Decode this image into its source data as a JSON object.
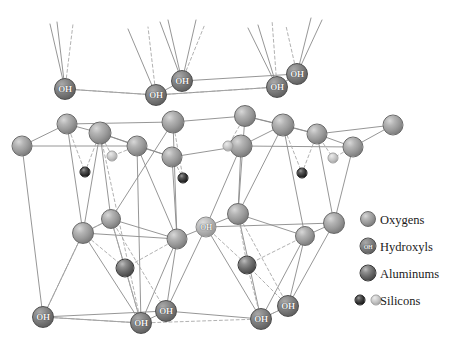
{
  "figure": {
    "background_color": "#ffffff",
    "width": 450,
    "height": 341
  },
  "legend": {
    "items": [
      {
        "label": "Oxygens",
        "species": "oxygen",
        "color": "#9a9a9a",
        "atom_label": ""
      },
      {
        "label": "Hydroxyls",
        "species": "hydroxyl",
        "color": "#757575",
        "atom_label": "OH"
      },
      {
        "label": "Aluminums",
        "species": "aluminum",
        "color": "#6b6b6b",
        "atom_label": ""
      },
      {
        "label": "Silicons",
        "species": "silicon",
        "color": "#333333",
        "atom_label": ""
      }
    ]
  },
  "atom_labels": {
    "hydroxyl": "OH"
  },
  "structure": {
    "atoms": [
      {
        "name": "hydroxyl-top-1",
        "species": "hydroxyl",
        "x": 65,
        "y": 89,
        "r": 11,
        "label": "OH"
      },
      {
        "name": "hydroxyl-top-2",
        "species": "hydroxyl",
        "x": 156,
        "y": 95,
        "r": 11,
        "label": "OH"
      },
      {
        "name": "hydroxyl-top-3",
        "species": "hydroxyl",
        "x": 182,
        "y": 81,
        "r": 11,
        "label": "OH"
      },
      {
        "name": "hydroxyl-top-4",
        "species": "hydroxyl",
        "x": 277,
        "y": 87,
        "r": 11,
        "label": "OH"
      },
      {
        "name": "hydroxyl-top-5",
        "species": "hydroxyl",
        "x": 297,
        "y": 74,
        "r": 11,
        "label": "OH"
      },
      {
        "name": "oxygen-u-1",
        "species": "oxygen",
        "x": 22,
        "y": 146,
        "r": 10.5,
        "label": ""
      },
      {
        "name": "oxygen-u-2",
        "species": "oxygen",
        "x": 67,
        "y": 124,
        "r": 10.5,
        "label": ""
      },
      {
        "name": "oxygen-u-3",
        "species": "oxygen",
        "x": 100,
        "y": 133,
        "r": 11.5,
        "label": ""
      },
      {
        "name": "oxygen-u-4",
        "species": "oxygen",
        "x": 137,
        "y": 146,
        "r": 10.5,
        "label": ""
      },
      {
        "name": "oxygen-u-5",
        "species": "oxygen",
        "x": 173,
        "y": 122,
        "r": 11.5,
        "label": ""
      },
      {
        "name": "oxygen-u-6",
        "species": "oxygen",
        "x": 172,
        "y": 157,
        "r": 10.5,
        "label": ""
      },
      {
        "name": "oxygen-u-7",
        "species": "oxygen",
        "x": 245,
        "y": 116,
        "r": 11,
        "label": ""
      },
      {
        "name": "oxygen-u-8",
        "species": "oxygen",
        "x": 241,
        "y": 146,
        "r": 11.5,
        "label": ""
      },
      {
        "name": "oxygen-u-9",
        "species": "oxygen",
        "x": 283,
        "y": 125,
        "r": 11.5,
        "label": ""
      },
      {
        "name": "oxygen-u-10",
        "species": "oxygen",
        "x": 317,
        "y": 134,
        "r": 10.5,
        "label": ""
      },
      {
        "name": "oxygen-u-11",
        "species": "oxygen",
        "x": 353,
        "y": 147,
        "r": 10.5,
        "label": ""
      },
      {
        "name": "oxygen-u-12",
        "species": "oxygen",
        "x": 393,
        "y": 125,
        "r": 10.5,
        "label": ""
      },
      {
        "name": "silicon-dark-1",
        "species": "silicon-dark",
        "x": 85,
        "y": 172,
        "r": 5.5,
        "label": ""
      },
      {
        "name": "silicon-dark-2",
        "species": "silicon-dark",
        "x": 183,
        "y": 178,
        "r": 5.5,
        "label": ""
      },
      {
        "name": "silicon-dark-3",
        "species": "silicon-dark",
        "x": 302,
        "y": 173,
        "r": 5.5,
        "label": ""
      },
      {
        "name": "silicon-light-1",
        "species": "silicon-light",
        "x": 112,
        "y": 156,
        "r": 5.5,
        "label": ""
      },
      {
        "name": "silicon-light-2",
        "species": "silicon-light",
        "x": 228,
        "y": 146,
        "r": 5.5,
        "label": ""
      },
      {
        "name": "silicon-light-3",
        "species": "silicon-light",
        "x": 333,
        "y": 158,
        "r": 5.5,
        "label": ""
      },
      {
        "name": "oxygen-m-1",
        "species": "oxygen",
        "x": 83,
        "y": 233,
        "r": 11,
        "label": ""
      },
      {
        "name": "oxygen-m-2",
        "species": "oxygen",
        "x": 111,
        "y": 219,
        "r": 10,
        "label": ""
      },
      {
        "name": "oxygen-m-3",
        "species": "oxygen",
        "x": 177,
        "y": 239,
        "r": 10.5,
        "label": ""
      },
      {
        "name": "hydroxyl-m-1",
        "species": "hydroxyl-light",
        "x": 206,
        "y": 227,
        "r": 10.5,
        "label": "OH"
      },
      {
        "name": "oxygen-m-4",
        "species": "oxygen",
        "x": 238,
        "y": 214,
        "r": 11,
        "label": ""
      },
      {
        "name": "oxygen-m-5",
        "species": "oxygen",
        "x": 305,
        "y": 236,
        "r": 10,
        "label": ""
      },
      {
        "name": "oxygen-m-6",
        "species": "oxygen",
        "x": 334,
        "y": 223,
        "r": 11,
        "label": ""
      },
      {
        "name": "aluminum-1",
        "species": "aluminum",
        "x": 125,
        "y": 268,
        "r": 9.5,
        "label": ""
      },
      {
        "name": "aluminum-2",
        "species": "aluminum",
        "x": 247,
        "y": 265,
        "r": 9.5,
        "label": ""
      },
      {
        "name": "hydroxyl-bot-1",
        "species": "hydroxyl",
        "x": 43,
        "y": 317,
        "r": 11,
        "label": "OH"
      },
      {
        "name": "hydroxyl-bot-2",
        "species": "hydroxyl",
        "x": 141,
        "y": 323,
        "r": 11,
        "label": "OH"
      },
      {
        "name": "hydroxyl-bot-3",
        "species": "hydroxyl",
        "x": 166,
        "y": 311,
        "r": 11,
        "label": "OH"
      },
      {
        "name": "hydroxyl-bot-4",
        "species": "hydroxyl",
        "x": 261,
        "y": 319,
        "r": 11,
        "label": "OH"
      },
      {
        "name": "hydroxyl-bot-5",
        "species": "hydroxyl",
        "x": 288,
        "y": 306,
        "r": 11,
        "label": "OH"
      }
    ],
    "bonds_solid": [
      [
        65,
        89,
        156,
        95
      ],
      [
        156,
        95,
        277,
        87
      ],
      [
        277,
        87,
        297,
        74
      ],
      [
        182,
        81,
        297,
        74
      ],
      [
        65,
        89,
        50,
        24
      ],
      [
        65,
        89,
        57,
        22
      ],
      [
        156,
        95,
        128,
        29
      ],
      [
        182,
        81,
        168,
        20
      ],
      [
        182,
        81,
        160,
        22
      ],
      [
        182,
        81,
        196,
        20
      ],
      [
        277,
        87,
        258,
        25
      ],
      [
        277,
        87,
        248,
        28
      ],
      [
        297,
        74,
        311,
        18
      ],
      [
        297,
        74,
        322,
        20
      ],
      [
        156,
        95,
        182,
        81
      ],
      [
        22,
        146,
        67,
        124
      ],
      [
        67,
        124,
        100,
        133
      ],
      [
        22,
        146,
        137,
        146
      ],
      [
        67,
        124,
        173,
        122
      ],
      [
        100,
        133,
        137,
        146
      ],
      [
        137,
        146,
        172,
        157
      ],
      [
        100,
        133,
        172,
        157
      ],
      [
        173,
        122,
        245,
        116
      ],
      [
        245,
        116,
        283,
        125
      ],
      [
        241,
        146,
        283,
        125
      ],
      [
        172,
        157,
        241,
        146
      ],
      [
        283,
        125,
        317,
        134
      ],
      [
        317,
        134,
        353,
        147
      ],
      [
        241,
        146,
        353,
        147
      ],
      [
        245,
        116,
        317,
        134
      ],
      [
        353,
        147,
        393,
        125
      ],
      [
        317,
        134,
        393,
        125
      ],
      [
        22,
        146,
        43,
        317
      ],
      [
        67,
        124,
        83,
        233
      ],
      [
        100,
        133,
        83,
        233
      ],
      [
        100,
        133,
        111,
        219
      ],
      [
        137,
        146,
        141,
        323
      ],
      [
        172,
        157,
        177,
        239
      ],
      [
        137,
        146,
        177,
        239
      ],
      [
        173,
        122,
        111,
        219
      ],
      [
        173,
        122,
        177,
        239
      ],
      [
        245,
        116,
        238,
        214
      ],
      [
        241,
        146,
        206,
        227
      ],
      [
        241,
        146,
        238,
        214
      ],
      [
        283,
        125,
        305,
        236
      ],
      [
        317,
        134,
        334,
        223
      ],
      [
        353,
        147,
        334,
        223
      ],
      [
        283,
        125,
        238,
        214
      ],
      [
        83,
        233,
        111,
        219
      ],
      [
        111,
        219,
        177,
        239
      ],
      [
        177,
        239,
        206,
        227
      ],
      [
        206,
        227,
        238,
        214
      ],
      [
        238,
        214,
        305,
        236
      ],
      [
        305,
        236,
        334,
        223
      ],
      [
        83,
        233,
        177,
        239
      ],
      [
        206,
        227,
        334,
        223
      ],
      [
        83,
        233,
        43,
        317
      ],
      [
        83,
        233,
        141,
        323
      ],
      [
        111,
        219,
        141,
        323
      ],
      [
        177,
        239,
        141,
        323
      ],
      [
        177,
        239,
        166,
        311
      ],
      [
        206,
        227,
        166,
        311
      ],
      [
        206,
        227,
        261,
        319
      ],
      [
        238,
        214,
        261,
        319
      ],
      [
        305,
        236,
        261,
        319
      ],
      [
        305,
        236,
        288,
        306
      ],
      [
        334,
        223,
        288,
        306
      ],
      [
        43,
        317,
        141,
        323
      ],
      [
        141,
        323,
        166,
        311
      ],
      [
        166,
        311,
        261,
        319
      ],
      [
        261,
        319,
        288,
        306
      ],
      [
        43,
        317,
        166,
        311
      ]
    ],
    "bonds_dashed": [
      [
        65,
        89,
        156,
        95
      ],
      [
        156,
        95,
        277,
        87
      ],
      [
        277,
        87,
        297,
        74
      ],
      [
        65,
        89,
        73,
        24
      ],
      [
        156,
        95,
        148,
        27
      ],
      [
        182,
        81,
        205,
        24
      ],
      [
        277,
        87,
        272,
        20
      ],
      [
        297,
        74,
        286,
        26
      ],
      [
        67,
        124,
        85,
        172
      ],
      [
        100,
        133,
        85,
        172
      ],
      [
        100,
        133,
        112,
        156
      ],
      [
        137,
        146,
        112,
        156
      ],
      [
        173,
        122,
        183,
        178
      ],
      [
        172,
        157,
        183,
        178
      ],
      [
        245,
        116,
        228,
        146
      ],
      [
        241,
        146,
        228,
        146
      ],
      [
        283,
        125,
        302,
        173
      ],
      [
        317,
        134,
        302,
        173
      ],
      [
        317,
        134,
        333,
        158
      ],
      [
        353,
        147,
        333,
        158
      ],
      [
        100,
        133,
        141,
        323
      ],
      [
        111,
        219,
        83,
        233
      ],
      [
        111,
        219,
        125,
        268
      ],
      [
        177,
        239,
        125,
        268
      ],
      [
        83,
        233,
        125,
        268
      ],
      [
        206,
        227,
        247,
        265
      ],
      [
        238,
        214,
        247,
        265
      ],
      [
        305,
        236,
        247,
        265
      ],
      [
        43,
        317,
        141,
        323
      ],
      [
        141,
        323,
        261,
        319
      ],
      [
        261,
        319,
        288,
        306
      ],
      [
        125,
        268,
        141,
        323
      ],
      [
        247,
        265,
        261,
        319
      ],
      [
        247,
        265,
        288,
        306
      ],
      [
        111,
        219,
        166,
        311
      ],
      [
        238,
        214,
        288,
        306
      ],
      [
        83,
        233,
        43,
        317
      ]
    ]
  }
}
